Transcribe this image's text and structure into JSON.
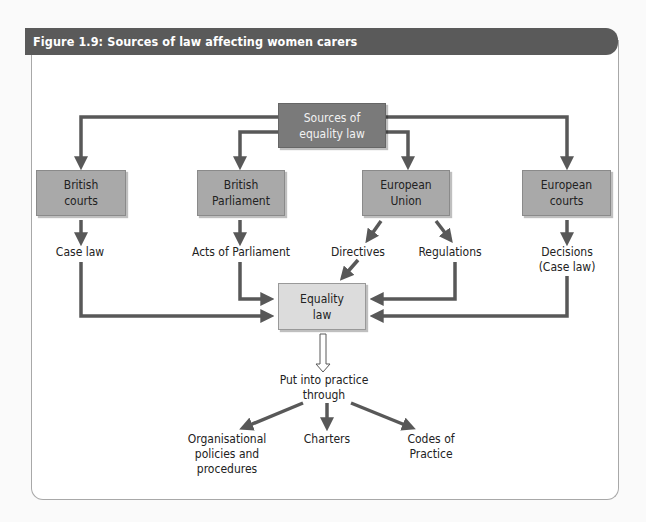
{
  "figure": {
    "title": "Figure 1.9: Sources of law affecting women carers"
  },
  "nodes": {
    "sources": {
      "line1": "Sources of",
      "line2": "equality law"
    },
    "british_courts": {
      "line1": "British",
      "line2": "courts"
    },
    "british_parliament": {
      "line1": "British",
      "line2": "Parliament"
    },
    "european_union": {
      "line1": "European",
      "line2": "Union"
    },
    "european_courts": {
      "line1": "European",
      "line2": "courts"
    },
    "equality_law": {
      "line1": "Equality",
      "line2": "law"
    }
  },
  "labels": {
    "case_law": "Case law",
    "acts_of_parliament": "Acts of Parliament",
    "directives": "Directives",
    "regulations": "Regulations",
    "decisions_line1": "Decisions",
    "decisions_line2": "(Case law)",
    "put_into_practice_line1": "Put into practice",
    "put_into_practice_line2": "through",
    "org_policies_line1": "Organisational",
    "org_policies_line2": "policies and",
    "org_policies_line3": "procedures",
    "charters": "Charters",
    "codes_line1": "Codes of",
    "codes_line2": "Practice"
  },
  "colors": {
    "header_bg": "#5a5a5a",
    "arrow": "#585858",
    "dark_box": "#7a7a7a",
    "mid_box": "#a9a9a9",
    "light_box": "#dcdcdc"
  }
}
